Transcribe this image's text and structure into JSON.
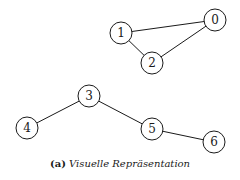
{
  "graph": {
    "node_radius": 11,
    "nodes": [
      {
        "id": "0",
        "label": "0",
        "x": 215,
        "y": 20
      },
      {
        "id": "1",
        "label": "1",
        "x": 121,
        "y": 33
      },
      {
        "id": "2",
        "label": "2",
        "x": 152,
        "y": 63
      },
      {
        "id": "3",
        "label": "3",
        "x": 89,
        "y": 96
      },
      {
        "id": "4",
        "label": "4",
        "x": 27,
        "y": 128
      },
      {
        "id": "5",
        "label": "5",
        "x": 152,
        "y": 129
      },
      {
        "id": "6",
        "label": "6",
        "x": 214,
        "y": 142
      }
    ],
    "edges": [
      {
        "from": "1",
        "to": "0"
      },
      {
        "from": "1",
        "to": "2"
      },
      {
        "from": "2",
        "to": "0"
      },
      {
        "from": "3",
        "to": "4"
      },
      {
        "from": "3",
        "to": "5"
      },
      {
        "from": "5",
        "to": "6"
      }
    ]
  },
  "caption": {
    "label": "(a)",
    "title": "Visuelle Repräsentation"
  }
}
